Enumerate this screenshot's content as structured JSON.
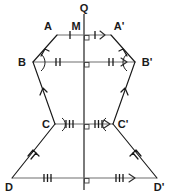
{
  "figure": {
    "type": "geometry-diagram",
    "background_color": "#ffffff",
    "stroke_color": "#1a1a1a",
    "connector_color": "#6e6e6e",
    "width": 172,
    "height": 195,
    "axis": {
      "name": "mirror-line",
      "label": "Q",
      "label_x": 84,
      "label_y": 11,
      "x": 84,
      "y_top": 14,
      "y_bottom": 190
    },
    "vertices": [
      {
        "id": "A",
        "label": "A",
        "x": 57,
        "y": 35,
        "label_x": 49,
        "label_y": 28
      },
      {
        "id": "M",
        "label": "M",
        "x": 84,
        "y": 35,
        "label_x": 77,
        "label_y": 28
      },
      {
        "id": "Ap",
        "label": "A'",
        "x": 111,
        "y": 35,
        "label_x": 115,
        "label_y": 28
      },
      {
        "id": "B",
        "label": "B",
        "x": 33,
        "y": 62,
        "label_x": 22,
        "label_y": 66
      },
      {
        "id": "Bp",
        "label": "B'",
        "x": 135,
        "y": 62,
        "label_x": 140,
        "label_y": 66
      },
      {
        "id": "C",
        "label": "C",
        "x": 55,
        "y": 124,
        "label_x": 45,
        "label_y": 128
      },
      {
        "id": "Cp",
        "label": "C'",
        "x": 113,
        "y": 124,
        "label_x": 117,
        "label_y": 128
      },
      {
        "id": "D",
        "label": "D",
        "x": 12,
        "y": 178,
        "label_x": 4,
        "label_y": 190
      },
      {
        "id": "Dp",
        "label": "D'",
        "x": 157,
        "y": 178,
        "label_x": 152,
        "label_y": 190
      }
    ],
    "connectors": [
      {
        "name": "connector-A-Aprime",
        "from": "A",
        "to": "Ap",
        "ticks": 1,
        "tick_left_x": 70,
        "tick_right_x": 98,
        "y": 35,
        "arrow_x": 104
      },
      {
        "name": "connector-B-Bprime",
        "from": "B",
        "to": "Bp",
        "ticks": 2,
        "tick_left_x": 57,
        "tick_right_x": 111,
        "y": 62,
        "arrow_x": 126
      },
      {
        "name": "connector-C-Cprime",
        "from": "C",
        "to": "Cp",
        "ticks": 3,
        "tick_left_x": 69,
        "tick_right_x": 99,
        "y": 124,
        "arrow_x": 108
      },
      {
        "name": "connector-D-Dprime",
        "from": "D",
        "to": "Dp",
        "ticks": 3,
        "tick_left_x": 47,
        "tick_right_x": 121,
        "y": 178,
        "arrow_x": 133
      }
    ],
    "edges": [
      {
        "name": "edge-A-B",
        "from": "A",
        "to": "B",
        "marks": 1
      },
      {
        "name": "edge-B-C",
        "from": "B",
        "to": "C",
        "marks": 1
      },
      {
        "name": "edge-C-D",
        "from": "C",
        "to": "D",
        "marks": 2
      },
      {
        "name": "edge-Ap-Bp",
        "from": "Ap",
        "to": "Bp",
        "marks": 1
      },
      {
        "name": "edge-Bp-Cp",
        "from": "Bp",
        "to": "Cp",
        "marks": 1
      },
      {
        "name": "edge-Cp-Dp",
        "from": "Cp",
        "to": "Dp",
        "marks": 2
      }
    ],
    "right_angle_markers": [
      {
        "name": "right-angle-at-M",
        "x": 84,
        "y": 35
      },
      {
        "name": "right-angle-at-B-line",
        "x": 84,
        "y": 62
      },
      {
        "name": "right-angle-at-C-line",
        "x": 84,
        "y": 124
      },
      {
        "name": "right-angle-at-D-line",
        "x": 84,
        "y": 178
      }
    ],
    "angle_arcs": [
      {
        "name": "angle-arc-at-B",
        "x": 33,
        "y": 62,
        "open": "right"
      },
      {
        "name": "angle-arc-at-Bp",
        "x": 135,
        "y": 62,
        "open": "left"
      },
      {
        "name": "angle-arc-at-C",
        "x": 55,
        "y": 124,
        "open": "right"
      },
      {
        "name": "angle-arc-at-Cp",
        "x": 113,
        "y": 124,
        "open": "left"
      }
    ]
  }
}
